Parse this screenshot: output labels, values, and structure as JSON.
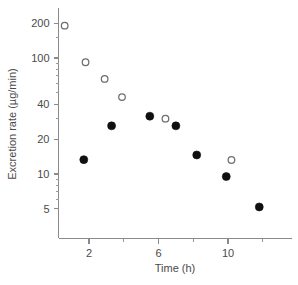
{
  "chart_data": {
    "type": "scatter",
    "title": "",
    "xlabel": "Time (h)",
    "ylabel": "Excretion rate (µg/min)",
    "xscale": "linear",
    "yscale": "log",
    "xlim": [
      0.2,
      13.0
    ],
    "ylim": [
      4.0,
      260
    ],
    "grid": false,
    "legend_position": "none",
    "xticks": [
      2,
      6,
      10
    ],
    "xtick_labels": [
      "2",
      "6",
      "10"
    ],
    "xticks_minor": [
      4,
      8,
      12
    ],
    "yticks": [
      200,
      100,
      40,
      20,
      10,
      5
    ],
    "ytick_labels": [
      "200",
      "100",
      "40",
      "20",
      "10",
      "5"
    ],
    "yticks_minor": [
      150,
      90,
      80,
      70,
      60,
      50,
      30,
      9,
      8,
      7,
      6
    ],
    "series": [
      {
        "name": "open-circles",
        "marker": "open-circle",
        "color": "#6d6d6d",
        "points": [
          {
            "x": 0.6,
            "y": 190
          },
          {
            "x": 1.8,
            "y": 92
          },
          {
            "x": 2.9,
            "y": 66
          },
          {
            "x": 3.9,
            "y": 46
          },
          {
            "x": 6.4,
            "y": 30
          },
          {
            "x": 10.2,
            "y": 13.2
          }
        ]
      },
      {
        "name": "filled-circles",
        "marker": "filled-circle",
        "color": "#101010",
        "points": [
          {
            "x": 1.7,
            "y": 13.3
          },
          {
            "x": 3.3,
            "y": 26
          },
          {
            "x": 5.5,
            "y": 31.5
          },
          {
            "x": 7.0,
            "y": 26
          },
          {
            "x": 8.2,
            "y": 14.6
          },
          {
            "x": 9.9,
            "y": 9.5
          },
          {
            "x": 11.8,
            "y": 5.2
          }
        ]
      }
    ]
  },
  "caption": {
    "text": ""
  }
}
